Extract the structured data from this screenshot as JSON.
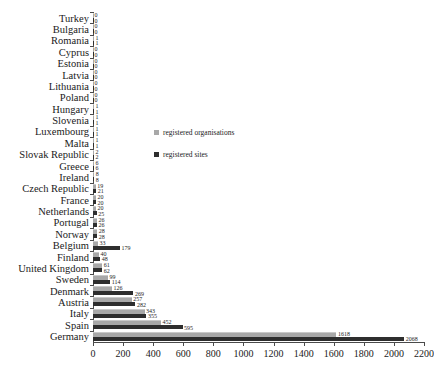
{
  "chart_data": {
    "type": "bar",
    "orientation": "horizontal",
    "title": "",
    "xlabel": "",
    "ylabel": "",
    "xlim": [
      0,
      2200
    ],
    "xticks": [
      0,
      200,
      400,
      600,
      800,
      1000,
      1200,
      1400,
      1600,
      1800,
      2000,
      2200
    ],
    "grid": false,
    "legend_position": "middle-left-inside",
    "categories": [
      "Turkey",
      "Bulgaria",
      "Romania",
      "Cyprus",
      "Estonia",
      "Latvia",
      "Lithuania",
      "Poland",
      "Hungary",
      "Slovenia",
      "Luxembourg",
      "Malta",
      "Slovak Republic",
      "Greece",
      "Ireland",
      "Czech Republic",
      "France",
      "Netherlands",
      "Portugal",
      "Norway",
      "Belgium",
      "Finland",
      "United Kingdom",
      "Sweden",
      "Denmark",
      "Austria",
      "Italy",
      "Spain",
      "Germany"
    ],
    "series": [
      {
        "name": "registered organisations",
        "color": "#a8a8a8",
        "values": [
          0,
          0,
          1,
          0,
          0,
          0,
          0,
          0,
          1,
          1,
          1,
          1,
          2,
          6,
          8,
          19,
          20,
          20,
          26,
          28,
          33,
          40,
          61,
          99,
          126,
          257,
          343,
          452,
          1618
        ]
      },
      {
        "name": "registered sites",
        "color": "#2e2e2e",
        "values": [
          0,
          0,
          1,
          0,
          0,
          0,
          0,
          0,
          1,
          1,
          1,
          1,
          2,
          6,
          8,
          21,
          20,
          25,
          26,
          28,
          179,
          48,
          62,
          114,
          269,
          282,
          355,
          595,
          2068
        ]
      }
    ]
  },
  "legend": {
    "items": [
      {
        "label": "registered organisations",
        "color": "#a8a8a8",
        "swatch": "square-swatch-light"
      },
      {
        "label": "registered sites",
        "color": "#2e2e2e",
        "swatch": "square-swatch-dark"
      }
    ]
  }
}
